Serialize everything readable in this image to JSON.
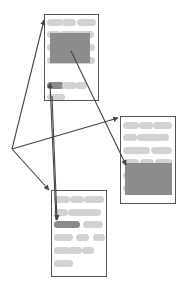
{
  "diagram": {
    "colors": {
      "background": "#ffffff",
      "box_border": "#555555",
      "pill": "#d2d2d2",
      "pill_highlight": "#8a8a8a",
      "block_highlight": "#8c8c8c",
      "arrow": "#444444"
    },
    "hub": {
      "x": 12,
      "y": 149
    },
    "boxes": [
      {
        "id": "doc-top",
        "x": 44,
        "y": 14,
        "w": 54,
        "h": 86,
        "pills": [
          {
            "x": 47,
            "y": 19,
            "w": 16,
            "h": 7
          },
          {
            "x": 62,
            "y": 19,
            "w": 14,
            "h": 7
          },
          {
            "x": 77,
            "y": 19,
            "w": 19,
            "h": 7
          },
          {
            "x": 47,
            "y": 31,
            "w": 14,
            "h": 7
          },
          {
            "x": 60,
            "y": 31,
            "w": 34,
            "h": 7
          },
          {
            "x": 47,
            "y": 44,
            "w": 48,
            "h": 7
          },
          {
            "x": 47,
            "y": 57,
            "w": 48,
            "h": 7
          },
          {
            "x": 47,
            "y": 82,
            "w": 17,
            "h": 7,
            "highlight": true
          },
          {
            "x": 62,
            "y": 82,
            "w": 14,
            "h": 7
          },
          {
            "x": 75,
            "y": 82,
            "w": 12,
            "h": 7
          },
          {
            "x": 47,
            "y": 94,
            "w": 18,
            "h": 6
          }
        ],
        "block": {
          "x": 50,
          "y": 33,
          "w": 40,
          "h": 30
        }
      },
      {
        "id": "doc-right",
        "x": 120,
        "y": 116,
        "w": 55,
        "h": 87,
        "pills": [
          {
            "x": 123,
            "y": 122,
            "w": 16,
            "h": 7
          },
          {
            "x": 139,
            "y": 122,
            "w": 14,
            "h": 7
          },
          {
            "x": 153,
            "y": 122,
            "w": 19,
            "h": 7
          },
          {
            "x": 123,
            "y": 134,
            "w": 14,
            "h": 7
          },
          {
            "x": 137,
            "y": 134,
            "w": 32,
            "h": 7
          },
          {
            "x": 123,
            "y": 147,
            "w": 27,
            "h": 7
          },
          {
            "x": 151,
            "y": 147,
            "w": 21,
            "h": 7
          },
          {
            "x": 123,
            "y": 159,
            "w": 16,
            "h": 7
          },
          {
            "x": 140,
            "y": 159,
            "w": 14,
            "h": 7
          },
          {
            "x": 155,
            "y": 159,
            "w": 17,
            "h": 7
          },
          {
            "x": 123,
            "y": 172,
            "w": 14,
            "h": 7
          },
          {
            "x": 123,
            "y": 185,
            "w": 14,
            "h": 7
          }
        ],
        "block": {
          "x": 125,
          "y": 163,
          "w": 47,
          "h": 32
        }
      },
      {
        "id": "doc-bottom",
        "x": 51,
        "y": 190,
        "w": 55,
        "h": 86,
        "pills": [
          {
            "x": 54,
            "y": 196,
            "w": 16,
            "h": 7
          },
          {
            "x": 70,
            "y": 196,
            "w": 14,
            "h": 7
          },
          {
            "x": 84,
            "y": 196,
            "w": 20,
            "h": 7
          },
          {
            "x": 54,
            "y": 209,
            "w": 14,
            "h": 7
          },
          {
            "x": 68,
            "y": 209,
            "w": 33,
            "h": 7
          },
          {
            "x": 54,
            "y": 221,
            "w": 26,
            "h": 7,
            "highlight": true
          },
          {
            "x": 83,
            "y": 221,
            "w": 20,
            "h": 7
          },
          {
            "x": 54,
            "y": 234,
            "w": 19,
            "h": 7
          },
          {
            "x": 76,
            "y": 234,
            "w": 13,
            "h": 7
          },
          {
            "x": 93,
            "y": 234,
            "w": 12,
            "h": 7
          },
          {
            "x": 54,
            "y": 247,
            "w": 16,
            "h": 7
          },
          {
            "x": 68,
            "y": 247,
            "w": 14,
            "h": 7
          },
          {
            "x": 82,
            "y": 247,
            "w": 12,
            "h": 7
          },
          {
            "x": 54,
            "y": 260,
            "w": 19,
            "h": 7
          }
        ],
        "block": null
      }
    ],
    "arrows": [
      {
        "id": "hub-to-top",
        "from": [
          12,
          149
        ],
        "to": [
          44,
          20
        ]
      },
      {
        "id": "hub-to-right",
        "from": [
          12,
          149
        ],
        "to": [
          118,
          118
        ]
      },
      {
        "id": "hub-to-bottom",
        "from": [
          12,
          149
        ],
        "to": [
          49,
          190
        ]
      },
      {
        "id": "top-block-to-right-block",
        "from": [
          71,
          51
        ],
        "to": [
          126,
          165
        ]
      },
      {
        "id": "bottom-pill-to-top-pill",
        "from": [
          56,
          220
        ],
        "to": [
          50,
          83
        ]
      },
      {
        "id": "top-to-bottom-pill",
        "from": [
          52,
          96
        ],
        "to": [
          57,
          220
        ]
      }
    ]
  }
}
